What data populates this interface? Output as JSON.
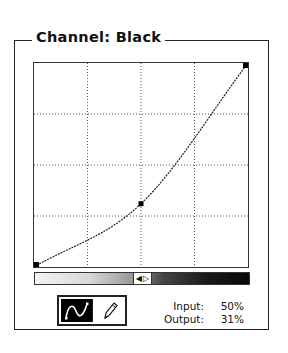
{
  "panel": {
    "title": "Channel: Black"
  },
  "curve": {
    "grid_divisions": 4,
    "points": [
      {
        "input": 0,
        "output": 0
      },
      {
        "input": 50,
        "output": 31
      },
      {
        "input": 100,
        "output": 100
      }
    ],
    "line_color": "#222222",
    "grid_color": "#555555"
  },
  "gradient_bar": {
    "start_color": "#f4f4f4",
    "end_color": "#080808",
    "toggle_icon": "left-right-arrows-icon",
    "toggle_left_glyph": "◀",
    "toggle_right_glyph": "▷"
  },
  "tools": [
    {
      "name": "curve-tool",
      "icon": "curve-points-icon",
      "active": true
    },
    {
      "name": "pencil-tool",
      "icon": "pencil-icon",
      "active": false
    }
  ],
  "readout": {
    "input_label": "Input:",
    "input_value": "50%",
    "output_label": "Output:",
    "output_value": "31%"
  }
}
